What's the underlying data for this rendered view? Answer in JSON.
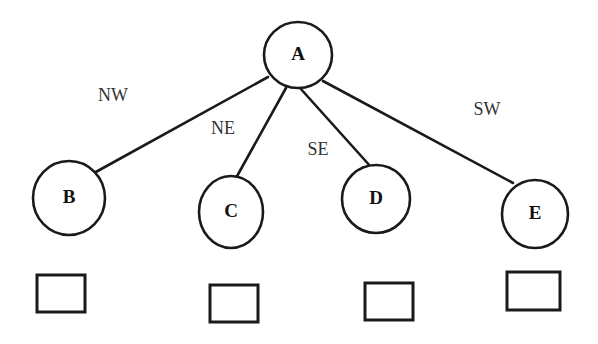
{
  "diagram": {
    "type": "tree",
    "background_color": "#ffffff",
    "stroke_color": "#1a1a1a",
    "nodes": [
      {
        "id": "A",
        "label": "A",
        "cx": 298,
        "cy": 55,
        "rx": 34,
        "ry": 33
      },
      {
        "id": "B",
        "label": "B",
        "cx": 69,
        "cy": 198,
        "rx": 36,
        "ry": 37
      },
      {
        "id": "C",
        "label": "C",
        "cx": 231,
        "cy": 212,
        "rx": 32,
        "ry": 36
      },
      {
        "id": "D",
        "label": "D",
        "cx": 376,
        "cy": 199,
        "rx": 34,
        "ry": 34
      },
      {
        "id": "E",
        "label": "E",
        "cx": 535,
        "cy": 214,
        "rx": 33,
        "ry": 34
      }
    ],
    "edges": [
      {
        "from": "A",
        "to": "B",
        "label": "NW",
        "label_x": 113,
        "label_y": 97,
        "x1": 268,
        "y1": 77,
        "x2": 94,
        "y2": 173
      },
      {
        "from": "A",
        "to": "C",
        "label": "NE",
        "label_x": 223,
        "label_y": 130,
        "x1": 286,
        "y1": 88,
        "x2": 236,
        "y2": 178
      },
      {
        "from": "A",
        "to": "D",
        "label": "SE",
        "label_x": 318,
        "label_y": 151,
        "x1": 300,
        "y1": 88,
        "x2": 371,
        "y2": 167
      },
      {
        "from": "A",
        "to": "E",
        "label": "SW",
        "label_x": 487,
        "label_y": 111,
        "x1": 323,
        "y1": 81,
        "x2": 513,
        "y2": 183
      }
    ],
    "swatches": [
      {
        "id": "swatch-1",
        "fill_pattern": "diagonal-hatch",
        "x": 37,
        "y": 275,
        "width": 48,
        "height": 37
      },
      {
        "id": "swatch-2",
        "fill_pattern": "diagonal-hatch",
        "x": 210,
        "y": 285,
        "width": 48,
        "height": 37
      },
      {
        "id": "swatch-3",
        "fill_pattern": "diagonal-hatch",
        "x": 365,
        "y": 283,
        "width": 48,
        "height": 37
      },
      {
        "id": "swatch-4",
        "fill_pattern": "empty",
        "x": 507,
        "y": 272,
        "width": 53,
        "height": 38
      }
    ]
  }
}
